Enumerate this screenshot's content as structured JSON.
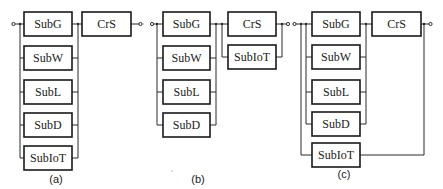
{
  "diagram": {
    "type": "reliability-block-diagram",
    "panels": [
      {
        "id": "a",
        "caption": "(a)",
        "parallel_group": [
          "SubG",
          "SubW",
          "SubL",
          "SubD",
          "SubIoT"
        ],
        "series_block": "CrS"
      },
      {
        "id": "b",
        "caption": "(b)",
        "parallel_group": [
          "SubG",
          "SubW",
          "SubL",
          "SubD"
        ],
        "second_parallel_group": [
          "CrS",
          "SubIoT"
        ]
      },
      {
        "id": "c",
        "caption": "(c)",
        "parallel_group": [
          "SubG",
          "SubW",
          "SubL",
          "SubD"
        ],
        "series_block": "CrS",
        "bypass_block": "SubIoT"
      }
    ]
  },
  "labels": {
    "a": {
      "subg": "SubG",
      "subw": "SubW",
      "subl": "SubL",
      "subd": "SubD",
      "subiot": "SubIoT",
      "crs": "CrS",
      "caption": "(a)"
    },
    "b": {
      "subg": "SubG",
      "subw": "SubW",
      "subl": "SubL",
      "subd": "SubD",
      "subiot": "SubIoT",
      "crs": "CrS",
      "caption": "(b)"
    },
    "c": {
      "subg": "SubG",
      "subw": "SubW",
      "subl": "SubL",
      "subd": "SubD",
      "subiot": "SubIoT",
      "crs": "CrS",
      "caption": "(c)"
    }
  },
  "colors": {
    "line": "#2a2a2a",
    "box_border": "#1a1a1a",
    "background": "#ffffff"
  }
}
